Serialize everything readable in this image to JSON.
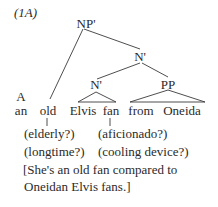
{
  "label": "(1A)",
  "tree": {
    "root": "NP'",
    "n_bar_upper": "N'",
    "n_bar_lower": "N'",
    "pp": "PP",
    "det_label": "A"
  },
  "words": {
    "det": "an",
    "adj": "old",
    "noun1": "Elvis",
    "noun2": "fan",
    "prep": "from",
    "pobj": "Oneida"
  },
  "glosses": {
    "old_1": "(elderly?)",
    "old_2": "(longtime?)",
    "fan_1": "(aficionado?)",
    "fan_2": "(cooling device?)"
  },
  "paraphrase": {
    "line1": "[She's an old fan compared to",
    "line2": "Oneidan Elvis fans.]"
  }
}
